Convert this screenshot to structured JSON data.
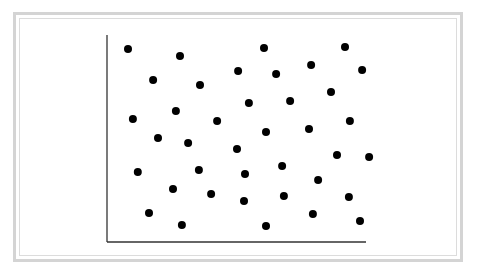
{
  "chart_data": {
    "type": "scatter",
    "title": "",
    "xlabel": "",
    "ylabel": "",
    "xlim": [
      0,
      100
    ],
    "ylim": [
      0,
      100
    ],
    "grid": false,
    "legend": null,
    "marker_color": "#000000",
    "axis_color": "#333333",
    "series": [
      {
        "name": "points",
        "points": [
          {
            "x": 8.1,
            "y": 93.2
          },
          {
            "x": 28.2,
            "y": 89.9
          },
          {
            "x": 60.6,
            "y": 93.7
          },
          {
            "x": 91.9,
            "y": 94.2
          },
          {
            "x": 17.8,
            "y": 78.3
          },
          {
            "x": 35.9,
            "y": 75.8
          },
          {
            "x": 50.6,
            "y": 82.6
          },
          {
            "x": 65.3,
            "y": 81.2
          },
          {
            "x": 78.8,
            "y": 85.5
          },
          {
            "x": 98.5,
            "y": 83.1
          },
          {
            "x": 86.5,
            "y": 72.5
          },
          {
            "x": 54.8,
            "y": 67.1
          },
          {
            "x": 70.7,
            "y": 68.1
          },
          {
            "x": 10.0,
            "y": 59.4
          },
          {
            "x": 26.6,
            "y": 63.3
          },
          {
            "x": 42.5,
            "y": 58.5
          },
          {
            "x": 93.8,
            "y": 58.5
          },
          {
            "x": 19.7,
            "y": 50.2
          },
          {
            "x": 31.3,
            "y": 47.8
          },
          {
            "x": 61.4,
            "y": 53.1
          },
          {
            "x": 78.0,
            "y": 54.6
          },
          {
            "x": 50.2,
            "y": 44.9
          },
          {
            "x": 88.8,
            "y": 42.0
          },
          {
            "x": 101.2,
            "y": 41.1
          },
          {
            "x": 11.9,
            "y": 33.8
          },
          {
            "x": 35.5,
            "y": 34.8
          },
          {
            "x": 53.3,
            "y": 32.9
          },
          {
            "x": 67.6,
            "y": 36.7
          },
          {
            "x": 81.5,
            "y": 30.0
          },
          {
            "x": 25.5,
            "y": 25.6
          },
          {
            "x": 40.2,
            "y": 23.2
          },
          {
            "x": 52.9,
            "y": 19.8
          },
          {
            "x": 68.3,
            "y": 22.2
          },
          {
            "x": 93.4,
            "y": 21.7
          },
          {
            "x": 16.2,
            "y": 14.0
          },
          {
            "x": 28.9,
            "y": 8.2
          },
          {
            "x": 61.4,
            "y": 7.7
          },
          {
            "x": 79.5,
            "y": 13.5
          },
          {
            "x": 97.7,
            "y": 10.1
          }
        ]
      }
    ]
  },
  "plot_layout": {
    "origin_px": [
      107,
      242
    ],
    "x_end_px": 366,
    "y_top_px": 35,
    "marker_radius": 4
  }
}
